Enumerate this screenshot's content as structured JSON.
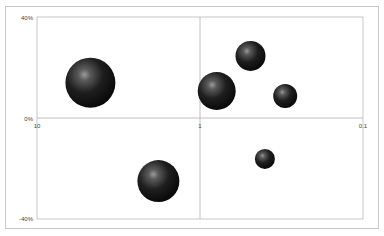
{
  "chart_data": {
    "type": "bubble",
    "title": "",
    "xlabel": "",
    "ylabel": "",
    "x_scale": "log",
    "x_reversed": true,
    "xlim": [
      10,
      0.1
    ],
    "ylim": [
      -0.4,
      0.4
    ],
    "x_ticks": [
      "10",
      "1",
      "0.1"
    ],
    "y_ticks": [
      "40%",
      "0%",
      "-40%"
    ],
    "grid": false,
    "legend": null,
    "bubble_style": "3D dark sphere",
    "bubble_color": "#1a1a1a",
    "points": [
      {
        "x": 4.7,
        "y": 0.14,
        "size": 25
      },
      {
        "x": 1.8,
        "y": -0.25,
        "size": 21
      },
      {
        "x": 0.79,
        "y": 0.107,
        "size": 19
      },
      {
        "x": 0.49,
        "y": 0.246,
        "size": 15
      },
      {
        "x": 0.3,
        "y": 0.087,
        "size": 12
      },
      {
        "x": 0.4,
        "y": -0.162,
        "size": 10
      }
    ]
  },
  "axes": {
    "y_top_label": "40%",
    "y_mid_label": "0%",
    "y_bottom_label": "-40%",
    "x_left_label": "10",
    "x_mid_label": "1",
    "x_right_label": "0.1"
  }
}
